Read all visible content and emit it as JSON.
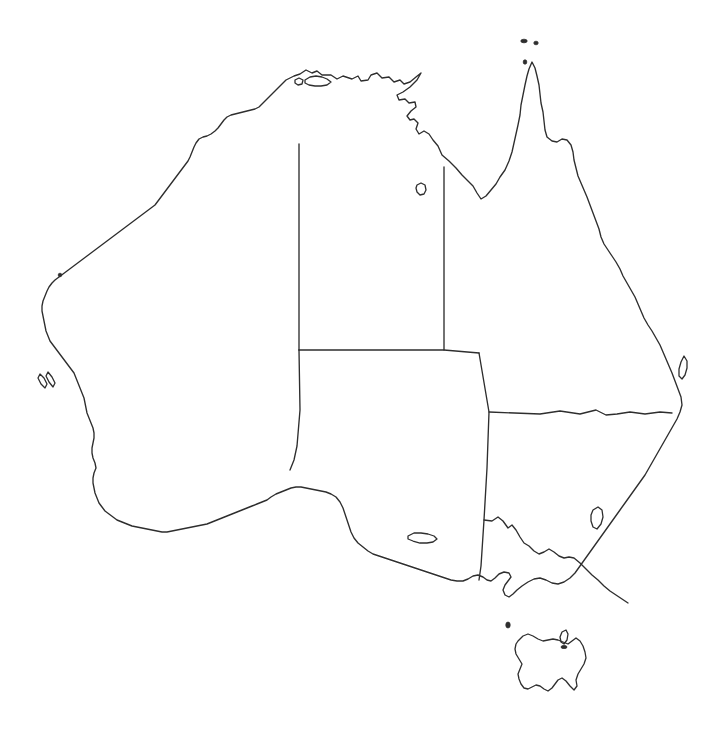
{
  "map": {
    "title": "Australia",
    "type": "blank-outline-map",
    "projection_note": "equirectangular",
    "canvas": {
      "width": 720,
      "height": 737
    },
    "colors": {
      "background": "#ffffff",
      "coastline": "#2e2e2e",
      "state_border": "#2e2e2e",
      "land_fill": "none"
    },
    "line_widths": {
      "coastline": 1.35,
      "state_border": 1.35,
      "island": 1.3
    },
    "labels_shown": false,
    "legend_shown": false,
    "graticule_shown": false
  },
  "features": {
    "mainland": {
      "name": "Australian mainland",
      "data_name": "mainland-coastline",
      "path": "M 300 74 L 306 70 L 312 73 L 317 71 L 322 75 L 331 75 L 337 79 L 343 76 L 352 79 L 358 76 L 361 81 L 368 80 L 371 75 L 377 73 L 382 78 L 389 77 L 394 82 L 400 80 L 404 84 L 410 82 L 416 77 L 421 73 L 417 80 L 410 87 L 403 92 L 397 95 L 399 100 L 405 99 L 409 103 L 415 102 L 416 107 L 411 111 L 407 116 L 410 120 L 414 119 L 418 123 L 416 129 L 419 134 L 424 131 L 429 134 L 433 140 L 438 146 L 442 155 L 449 161 L 456 168 L 462 175 L 468 181 L 473 186 L 477 193 L 481 199 L 486 196 L 491 190 L 496 184 L 500 177 L 505 170 L 509 161 L 512 152 L 514 143 L 516 134 L 518 125 L 520 115 L 521 105 L 523 95 L 525 85 L 527 76 L 529 69 L 532 62 L 535 68 L 537 76 L 539 85 L 540 94 L 541 103 L 543 112 L 544 121 L 545 130 L 547 137 L 552 141 L 557 142 L 562 139 L 567 140 L 571 145 L 573 152 L 574 160 L 576 168 L 578 176 L 581 183 L 584 190 L 587 197 L 590 205 L 593 213 L 596 221 L 599 229 L 601 237 L 604 244 L 608 250 L 612 256 L 616 262 L 620 269 L 623 276 L 627 283 L 631 290 L 635 297 L 638 304 L 641 311 L 644 318 L 648 325 L 652 331 L 656 338 L 660 345 L 663 352 L 666 359 L 669 366 L 672 373 L 675 381 L 678 389 L 681 397 L 682 405 L 680 412 L 677 419 L 673 426 L 669 433 L 665 440 L 661 447 L 657 454 L 653 461 L 649 468 L 645 475 L 640 482 L 635 489 L 630 496 L 625 503 L 620 510 L 615 517 L 610 524 L 605 531 L 600 538 L 595 545 L 590 552 L 585 559 L 580 566 L 575 573 L 570 578 L 564 582 L 558 584 L 552 583 L 546 580 L 540 578 L 534 579 L 528 582 L 522 586 L 517 590 L 513 594 L 509 597 L 505 595 L 503 590 L 505 585 L 508 581 L 511 577 L 509 573 L 504 572 L 499 574 L 495 578 L 491 581 L 487 580 L 483 577 L 478 575 L 473 576 L 468 579 L 463 581 L 457 581 L 451 580 L 445 578 L 439 576 L 433 574 L 427 572 L 421 570 L 415 568 L 409 566 L 403 564 L 397 562 L 391 560 L 385 558 L 379 556 L 373 554 L 368 551 L 363 547 L 358 543 L 354 538 L 351 532 L 349 526 L 347 520 L 345 514 L 343 508 L 340 502 L 336 497 L 331 494 L 326 492 L 321 491 L 316 490 L 311 489 L 306 488 L 301 487 L 296 487 L 291 488 L 286 490 L 281 492 L 276 494 L 271 497 L 267 500 L 262 502 L 257 504 L 252 506 L 247 508 L 242 510 L 237 512 L 232 514 L 227 516 L 222 518 L 217 520 L 212 522 L 207 524 L 202 525 L 197 526 L 192 527 L 187 528 L 182 529 L 177 530 L 172 531 L 167 532 L 162 532 L 157 531 L 152 530 L 147 529 L 142 528 L 137 527 L 132 526 L 127 524 L 122 522 L 117 520 L 113 517 L 109 514 L 105 511 L 102 507 L 99 503 L 97 498 L 95 493 L 94 488 L 93 483 L 93 478 L 94 473 L 96 468 L 95 463 L 93 458 L 92 453 L 92 448 L 93 443 L 94 438 L 94 433 L 93 428 L 91 423 L 89 418 L 87 413 L 86 408 L 85 403 L 84 398 L 82 393 L 80 388 L 78 383 L 76 378 L 74 373 L 71 369 L 68 365 L 65 361 L 62 357 L 59 353 L 56 349 L 53 345 L 50 341 L 48 336 L 46 331 L 45 326 L 44 321 L 43 316 L 42 311 L 42 306 L 43 301 L 45 296 L 47 291 L 49 287 L 52 283 L 55 280 L 59 277 L 63 274 L 67 271 L 71 268 L 75 265 L 79 262 L 83 259 L 87 256 L 91 253 L 95 250 L 99 247 L 103 244 L 107 241 L 111 238 L 115 235 L 119 232 L 123 229 L 127 226 L 131 223 L 135 220 L 139 217 L 143 214 L 147 211 L 151 208 L 155 205 L 158 201 L 161 197 L 164 193 L 167 189 L 170 185 L 173 181 L 176 177 L 179 173 L 182 169 L 185 165 L 188 161 L 190 157 L 192 152 L 194 147 L 196 143 L 199 139 L 203 137 L 207 136 L 211 134 L 215 131 L 218 128 L 221 124 L 224 120 L 227 117 L 231 115 L 235 114 L 239 113 L 243 112 L 247 111 L 251 110 L 255 109 L 259 107 L 262 104 L 265 101 L 268 98 L 271 95 L 274 92 L 277 89 L 280 86 L 283 83 L 286 80 L 290 78 L 294 76 L 297 75 Z"
    },
    "state_borders": [
      {
        "name": "Western Australia / Northern Territory and South Australia (129 E)",
        "data_name": "border-wa-nt-sa",
        "path": "M 299 144 L 299 350"
      },
      {
        "name": "Northern Territory / Queensland (138 E)",
        "data_name": "border-nt-qld",
        "path": "M 444 167 L 444 350"
      },
      {
        "name": "Northern Territory / South Australia (26 S)",
        "data_name": "border-nt-sa",
        "path": "M 299 350 L 444 350 L 479 353"
      },
      {
        "name": "South Australia / Western Australia southern segment to Bight",
        "data_name": "border-sa-wa-south",
        "path": "M 299 350 L 300 410 L 297 446 L 294 460 L 290 470"
      },
      {
        "name": "South Australia / Queensland and New South Wales eastern edge",
        "data_name": "border-sa-qld-nsw",
        "path": "M 479 353 L 489 412 L 487 468 L 484 520 L 481 566 L 479 580"
      },
      {
        "name": "Queensland / New South Wales (29 S, Dumaresq-Macintyre)",
        "data_name": "border-qld-nsw",
        "path": "M 489 412 L 540 414 L 560 411 L 580 414 L 596 410 L 606 415 L 617 414 L 630 412 L 645 414 L 660 412 L 672 413"
      },
      {
        "name": "New South Wales / Victoria (Murray River)",
        "data_name": "border-nsw-vic",
        "path": "M 484 520 L 492 521 L 498 517 L 503 521 L 508 528 L 512 525 L 516 530 L 520 537 L 524 543 L 529 546 L 534 551 L 539 554 L 544 552 L 549 549 L 554 552 L 559 556 L 564 558 L 569 557 L 574 558 L 580 563 L 586 569 L 592 575 L 598 580 L 604 586 L 610 591 L 616 595 L 622 599 L 628 603"
      }
    ],
    "islands": [
      {
        "name": "Tasmania",
        "data_name": "island-tasmania",
        "path": "M 518 641 L 523 636 L 528 634 L 533 636 L 538 639 L 543 641 L 548 640 L 553 639 L 558 640 L 563 642 L 568 644 L 572 641 L 576 638 L 580 641 L 583 646 L 585 652 L 586 658 L 584 664 L 581 669 L 578 674 L 576 680 L 577 686 L 574 690 L 570 686 L 566 681 L 562 678 L 558 680 L 555 684 L 552 688 L 548 691 L 544 689 L 540 686 L 536 685 L 532 687 L 528 689 L 524 688 L 521 684 L 519 679 L 518 674 L 520 669 L 522 664 L 519 659 L 516 654 L 515 649 L 516 644 Z"
      },
      {
        "name": "Kangaroo Island",
        "data_name": "island-kangaroo",
        "path": "M 408 536 L 414 533 L 421 533 L 428 534 L 434 536 L 437 539 L 433 542 L 427 543 L 420 543 L 413 541 L 408 539 Z"
      },
      {
        "name": "Melville Island and Bathurst Island",
        "data_name": "island-melville-bathurst",
        "path": "M 305 80 L 310 77 L 316 76 L 322 77 L 327 79 L 331 82 L 327 85 L 321 86 L 315 86 L 309 85 L 305 83 Z"
      },
      {
        "name": "Bathurst Island western islet",
        "data_name": "island-bathurst-west",
        "path": "M 295 80 L 299 78 L 303 80 L 302 84 L 298 85 L 295 83 Z"
      },
      {
        "name": "Groote Eylandt",
        "data_name": "island-groote-eylandt",
        "path": "M 417 185 L 421 183 L 425 185 L 426 190 L 424 194 L 420 195 L 417 192 L 416 188 Z"
      },
      {
        "name": "Fraser Island",
        "data_name": "island-fraser",
        "path": "M 684 356 L 687 361 L 687 368 L 685 375 L 682 379 L 679 376 L 679 369 L 681 362 Z"
      },
      {
        "name": "Australian Capital Territory",
        "data_name": "border-act",
        "path": "M 593 510 L 598 507 L 602 510 L 603 517 L 601 524 L 597 529 L 593 527 L 591 521 L 591 515 Z"
      },
      {
        "name": "Flinders Island",
        "data_name": "island-flinders",
        "path": "M 562 632 L 566 630 L 568 634 L 567 640 L 564 644 L 561 642 L 560 637 Z"
      },
      {
        "name": "Dirk Hartog Island",
        "data_name": "island-dirk-hartog",
        "path": "M 40 374 L 44 378 L 47 384 L 45 388 L 41 384 L 38 378 Z"
      },
      {
        "name": "Bernier Dorre Islands",
        "data_name": "island-bernier-dorre",
        "path": "M 48 372 L 52 377 L 55 383 L 53 387 L 49 382 L 46 376 Z"
      }
    ],
    "islets": [
      {
        "name": "Torres Strait island west",
        "data_name": "islet-torres-west",
        "cx": 524,
        "cy": 41,
        "rx": 3.2,
        "ry": 1.8
      },
      {
        "name": "Torres Strait island east",
        "data_name": "islet-torres-east",
        "cx": 536,
        "cy": 43,
        "rx": 2.2,
        "ry": 1.8
      },
      {
        "name": "Cape York tip islet",
        "data_name": "islet-cape-york",
        "cx": 525,
        "cy": 62,
        "rx": 1.8,
        "ry": 2.2
      },
      {
        "name": "Rottnest Island",
        "data_name": "islet-rottnest",
        "cx": 60,
        "cy": 275,
        "rx": 1.8,
        "ry": 1.8
      },
      {
        "name": "King Island",
        "data_name": "islet-king",
        "cx": 508,
        "cy": 625,
        "rx": 2.2,
        "ry": 3.0
      },
      {
        "name": "Flinders Island northern islet",
        "data_name": "islet-flinders-north",
        "cx": 564,
        "cy": 647,
        "rx": 3.0,
        "ry": 1.6
      }
    ]
  }
}
